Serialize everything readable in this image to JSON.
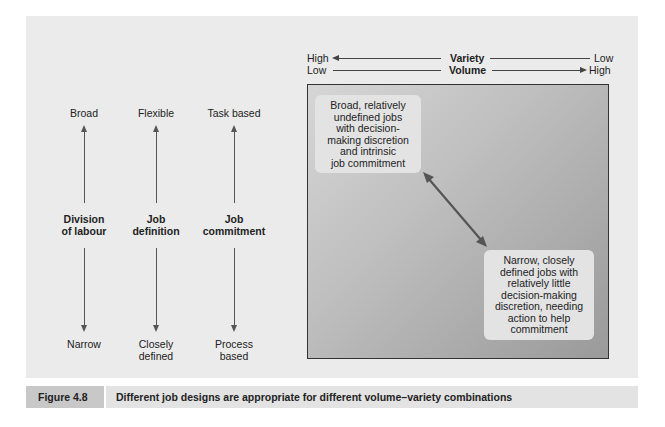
{
  "axes": {
    "variety": {
      "label": "Variety",
      "left": "High",
      "right": "Low",
      "arrow": "left"
    },
    "volume": {
      "label": "Volume",
      "left": "Low",
      "right": "High",
      "arrow": "right"
    }
  },
  "dimensions": [
    {
      "label_line1": "Division",
      "label_line2": "of labour",
      "top": "Broad",
      "bottom_line1": "Narrow",
      "bottom_line2": ""
    },
    {
      "label_line1": "Job",
      "label_line2": "definition",
      "top": "Flexible",
      "bottom_line1": "Closely",
      "bottom_line2": "defined"
    },
    {
      "label_line1": "Job",
      "label_line2": "commitment",
      "top": "Task based",
      "bottom_line1": "Process",
      "bottom_line2": "based"
    }
  ],
  "callouts": {
    "top_left": [
      "Broad, relatively",
      "undefined jobs",
      "with decision-",
      "making discretion",
      "and intrinsic",
      "job commitment"
    ],
    "bottom_right": [
      "Narrow, closely",
      "defined jobs with",
      "relatively little",
      "decision-making",
      "discretion, needing",
      "action to help",
      "commitment"
    ]
  },
  "caption": {
    "figure_label": "Figure 4.8",
    "text": "Different job designs are appropriate for different volume–variety combinations"
  },
  "colors": {
    "panel_bg": "#ebebeb",
    "caption_label_bg": "#c8c8c8",
    "caption_text_bg": "#e3e3e3",
    "arrow": "#555555"
  }
}
